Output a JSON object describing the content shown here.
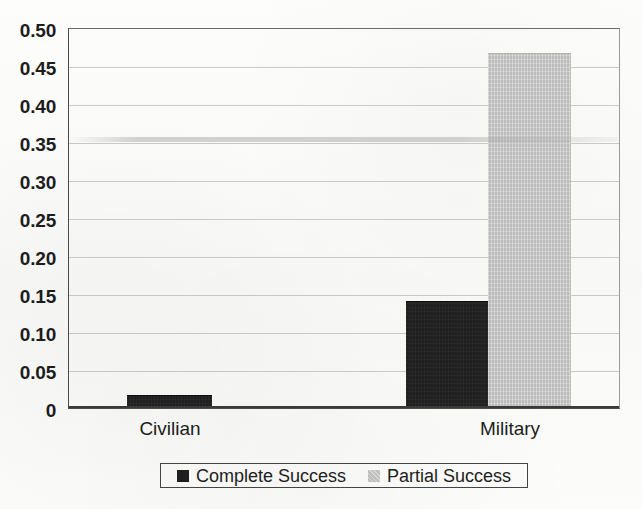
{
  "chart_data": {
    "type": "bar",
    "title": "",
    "xlabel": "",
    "ylabel": "",
    "categories": [
      "Civilian",
      "Military"
    ],
    "series": [
      {
        "name": "Complete Success",
        "color": "#1f1f1f",
        "values": [
          0.016,
          0.139
        ]
      },
      {
        "name": "Partial Success",
        "color": "#c6c6c6",
        "values": [
          0,
          0.465
        ]
      }
    ],
    "ylim": [
      0,
      0.5
    ],
    "yticks": [
      "0",
      "0.05",
      "0.10",
      "0.15",
      "0.20",
      "0.25",
      "0.30",
      "0.35",
      "0.40",
      "0.45",
      "0.50"
    ],
    "ytick_values": [
      0,
      0.05,
      0.1,
      0.15,
      0.2,
      0.25,
      0.3,
      0.35,
      0.4,
      0.45,
      0.5
    ],
    "grid": true,
    "legend_position": "bottom"
  },
  "axis": {
    "ticks": [
      {
        "label": "0.50",
        "value": 0.5
      },
      {
        "label": "0.45",
        "value": 0.45
      },
      {
        "label": "0.40",
        "value": 0.4
      },
      {
        "label": "0.35",
        "value": 0.35
      },
      {
        "label": "0.30",
        "value": 0.3
      },
      {
        "label": "0.25",
        "value": 0.25
      },
      {
        "label": "0.20",
        "value": 0.2
      },
      {
        "label": "0.15",
        "value": 0.15
      },
      {
        "label": "0.10",
        "value": 0.1
      },
      {
        "label": "0.05",
        "value": 0.05
      },
      {
        "label": "0",
        "value": 0
      }
    ]
  },
  "categories": [
    {
      "label": "Civilian"
    },
    {
      "label": "Military"
    }
  ],
  "bars": [
    {
      "name": "civilian-complete-success",
      "series": "Complete Success",
      "category": "Civilian",
      "value": 0.016
    },
    {
      "name": "military-complete-success",
      "series": "Complete Success",
      "category": "Military",
      "value": 0.139
    },
    {
      "name": "military-partial-success",
      "series": "Partial Success",
      "category": "Military",
      "value": 0.465
    }
  ],
  "legend": {
    "items": [
      {
        "label": "Complete Success",
        "color": "#1f1f1f"
      },
      {
        "label": "Partial Success",
        "color": "#c6c6c6"
      }
    ]
  }
}
